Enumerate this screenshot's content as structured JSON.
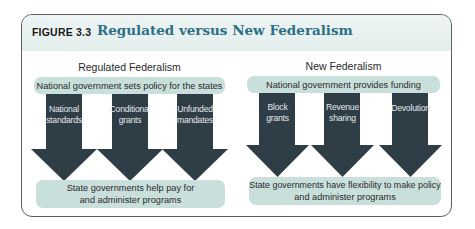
{
  "figure": {
    "label": "FIGURE 3.3",
    "title": "Regulated versus New Federalism"
  },
  "colors": {
    "title": "#2e6e86",
    "arrow": "#2f3d47",
    "box_fill": "#c8dfdc",
    "header_fill": "#e6f0ef",
    "arrow_text": "#e3e8ea"
  },
  "left": {
    "heading": "Regulated Federalism",
    "top_box": "National government sets policy for the states",
    "arrows": [
      {
        "line1": "National",
        "line2": "standards"
      },
      {
        "line1": "Conditional",
        "line2": "grants"
      },
      {
        "line1": "Unfunded",
        "line2": "mandates"
      }
    ],
    "bottom_box": {
      "line1": "State governments help pay for",
      "line2": "and administer programs"
    }
  },
  "right": {
    "heading": "New Federalism",
    "top_box": "National government provides funding",
    "arrows": [
      {
        "line1": "Block",
        "line2": "grants"
      },
      {
        "line1": "Revenue",
        "line2": "sharing"
      },
      {
        "line1": "Devolution",
        "line2": ""
      }
    ],
    "bottom_box": {
      "line1": "State governments have flexibility to make policy",
      "line2": "and administer programs"
    }
  }
}
